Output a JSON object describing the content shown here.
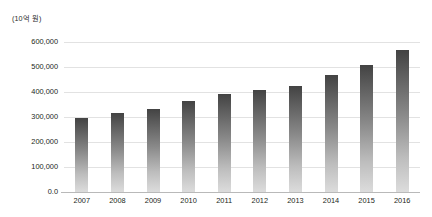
{
  "chart_data": {
    "type": "bar",
    "title": "",
    "subtitle": "",
    "xlabel": "",
    "ylabel": "",
    "unit_label": "(10억 원)",
    "categories": [
      "2007",
      "2008",
      "2009",
      "2010",
      "2011",
      "2012",
      "2013",
      "2014",
      "2015",
      "2016"
    ],
    "values": [
      295000,
      318000,
      333000,
      365000,
      393000,
      410000,
      425000,
      470000,
      508000,
      570000
    ],
    "ylim": [
      0,
      600000
    ],
    "ytick_values": [
      600000,
      500000,
      400000,
      300000,
      200000,
      100000,
      0
    ],
    "ytick_labels": [
      "600,000",
      "500,000",
      "400,000",
      "300,000",
      "200,000",
      "100,000",
      "0.0"
    ],
    "grid": true,
    "legend": false,
    "legend_position": "none",
    "series": [
      {
        "name": "",
        "values": [
          295000,
          318000,
          333000,
          365000,
          393000,
          410000,
          425000,
          470000,
          508000,
          570000
        ]
      }
    ],
    "colors": {
      "bar_top": "#434343",
      "bar_bottom": "#dcdcdc",
      "gridline": "#e2e2e2",
      "axis_line": "#b9b9b9",
      "text": "#231f20",
      "background": "#ffffff"
    }
  }
}
